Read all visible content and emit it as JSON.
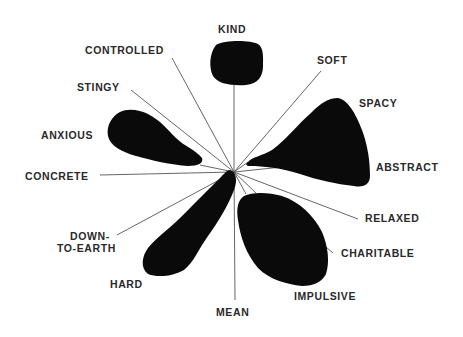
{
  "diagram": {
    "type": "semantic-differential-blot-star",
    "center": [
      234,
      172
    ],
    "labels": {
      "kind": "KIND",
      "controlled": "CONTROLLED",
      "soft": "SOFT",
      "stingy": "STINGY",
      "spacy": "SPACY",
      "anxious": "ANXIOUS",
      "abstract": "ABSTRACT",
      "concrete": "CONCRETE",
      "relaxed": "RELAXED",
      "down": "DOWN-",
      "to_earth": "TO-EARTH",
      "charitable": "CHARITABLE",
      "hard": "HARD",
      "impulsive": "IMPULSIVE",
      "mean": "MEAN"
    },
    "blobs": [
      {
        "name": "kind-blob",
        "axis": "KIND"
      },
      {
        "name": "anxious-blob",
        "axis": "ANXIOUS"
      },
      {
        "name": "spacy-abstract-blob",
        "axis": "SPACY / ABSTRACT"
      },
      {
        "name": "hard-blob",
        "axis": "HARD"
      },
      {
        "name": "charitable-impulsive-blob",
        "axis": "CHARITABLE / IMPULSIVE"
      }
    ],
    "colors": {
      "blob": "#0a0a0a",
      "line": "#555555",
      "text": "#2a2a2a",
      "background": "#ffffff"
    }
  }
}
